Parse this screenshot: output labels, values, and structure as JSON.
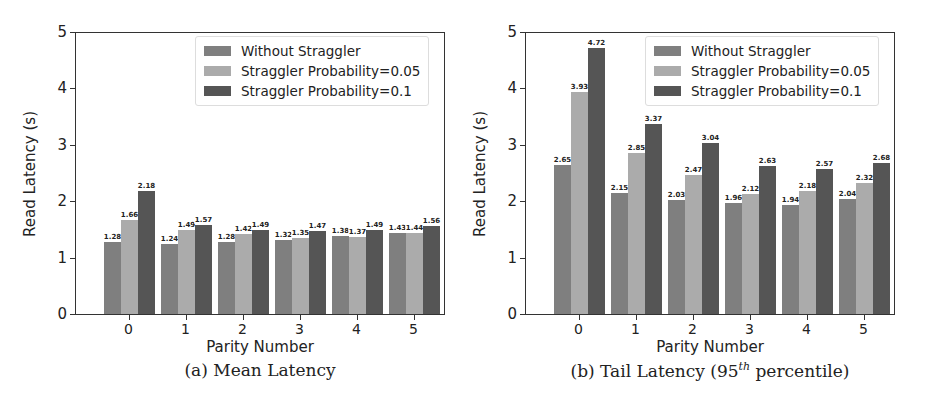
{
  "chart_data": [
    {
      "type": "bar",
      "title": "(a) Mean Latency",
      "xlabel": "Parity Number",
      "ylabel": "Read Latency (s)",
      "ylim": [
        0,
        5
      ],
      "yticks": [
        "0",
        "1",
        "2",
        "3",
        "4",
        "5"
      ],
      "categories": [
        "0",
        "1",
        "2",
        "3",
        "4",
        "5"
      ],
      "grid": false,
      "legend_position": "upper right",
      "series": [
        {
          "name": "Without Straggler",
          "color": "#7f7f7f",
          "values": [
            1.28,
            1.24,
            1.28,
            1.32,
            1.38,
            1.43
          ]
        },
        {
          "name": "Straggler Probability=0.05",
          "color": "#ababab",
          "values": [
            1.66,
            1.49,
            1.42,
            1.35,
            1.37,
            1.44
          ]
        },
        {
          "name": "Straggler Probability=0.1",
          "color": "#555555",
          "values": [
            2.18,
            1.57,
            1.49,
            1.47,
            1.49,
            1.56
          ]
        }
      ]
    },
    {
      "type": "bar",
      "title": "(b) Tail Latency (95th percentile)",
      "xlabel": "Parity Number",
      "ylabel": "Read Latency (s)",
      "ylim": [
        0,
        5
      ],
      "yticks": [
        "0",
        "1",
        "2",
        "3",
        "4",
        "5"
      ],
      "categories": [
        "0",
        "1",
        "2",
        "3",
        "4",
        "5"
      ],
      "grid": false,
      "legend_position": "upper right",
      "series": [
        {
          "name": "Without Straggler",
          "color": "#7f7f7f",
          "values": [
            2.65,
            2.15,
            2.03,
            1.96,
            1.94,
            2.04
          ]
        },
        {
          "name": "Straggler Probability=0.05",
          "color": "#ababab",
          "values": [
            3.93,
            2.85,
            2.47,
            2.12,
            2.18,
            2.32
          ]
        },
        {
          "name": "Straggler Probability=0.1",
          "color": "#555555",
          "values": [
            4.72,
            3.37,
            3.04,
            2.63,
            2.57,
            2.68
          ]
        }
      ]
    }
  ],
  "captions": {
    "left": "(a) Mean Latency",
    "right_prefix": "(b) Tail Latency (95",
    "right_sup": "th",
    "right_suffix": " percentile)"
  }
}
